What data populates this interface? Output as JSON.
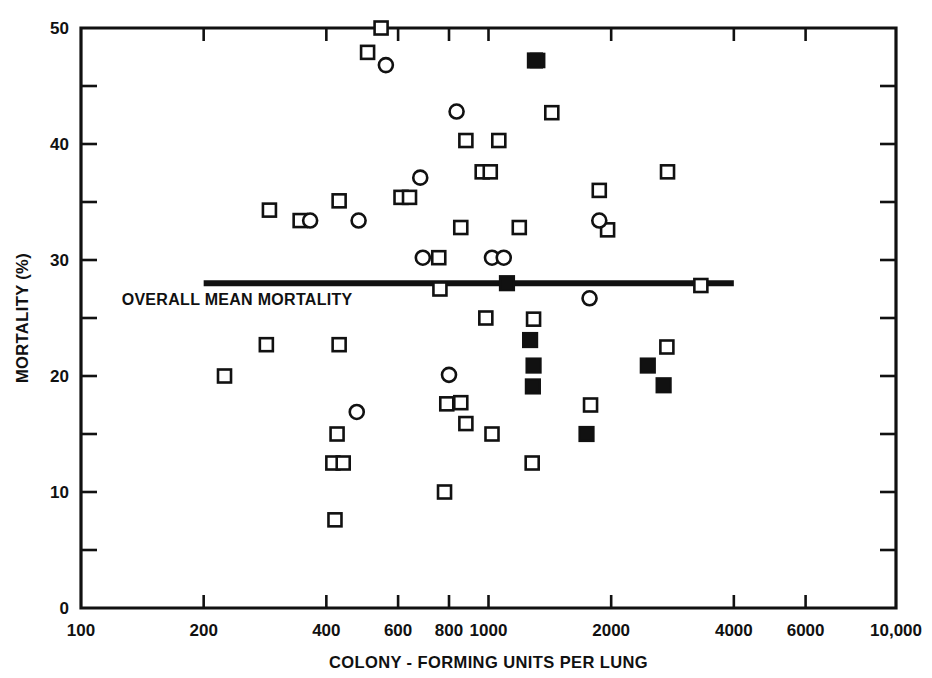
{
  "chart_data": {
    "type": "scatter",
    "title": "",
    "xlabel": "COLONY - FORMING UNITS PER LUNG",
    "ylabel": "MORTALITY (%)",
    "xscale": "log",
    "yscale": "linear",
    "xlim": [
      100,
      10000
    ],
    "ylim": [
      0,
      50
    ],
    "grid": false,
    "legend": "none",
    "x_tick_labels": [
      "100",
      "200",
      "400",
      "600",
      "800",
      "1000",
      "2000",
      "4000",
      "6000",
      "10,000"
    ],
    "x_tick_values": [
      100,
      200,
      400,
      600,
      800,
      1000,
      2000,
      4000,
      6000,
      10000
    ],
    "y_tick_labels": [
      "0",
      "10",
      "20",
      "30",
      "40",
      "50"
    ],
    "y_tick_values": [
      0,
      10,
      20,
      30,
      40,
      50
    ],
    "y_minor_ticks": [
      5,
      15,
      25,
      35,
      45
    ],
    "annotations": [
      {
        "text": "OVERALL MEAN MORTALITY",
        "type": "reference-line-label",
        "y_value": 28,
        "x_start": 200,
        "x_end": 4000
      }
    ],
    "reference_line": {
      "label": "OVERALL MEAN MORTALITY",
      "y": 28,
      "x_start": 200,
      "x_end": 4000,
      "color": "#111111"
    },
    "series": [
      {
        "name": "open-square",
        "marker": "open-square",
        "color": "#111111",
        "points": [
          {
            "x": 545,
            "y": 50.0
          },
          {
            "x": 505,
            "y": 47.9
          },
          {
            "x": 1320,
            "y": 47.2
          },
          {
            "x": 1430,
            "y": 42.7
          },
          {
            "x": 880,
            "y": 40.3
          },
          {
            "x": 1060,
            "y": 40.3
          },
          {
            "x": 2750,
            "y": 37.6
          },
          {
            "x": 965,
            "y": 37.6
          },
          {
            "x": 1010,
            "y": 37.6
          },
          {
            "x": 1870,
            "y": 36.0
          },
          {
            "x": 610,
            "y": 35.4
          },
          {
            "x": 640,
            "y": 35.4
          },
          {
            "x": 290,
            "y": 34.3
          },
          {
            "x": 430,
            "y": 35.1
          },
          {
            "x": 345,
            "y": 33.4
          },
          {
            "x": 1960,
            "y": 32.6
          },
          {
            "x": 855,
            "y": 32.8
          },
          {
            "x": 1190,
            "y": 32.8
          },
          {
            "x": 755,
            "y": 30.2
          },
          {
            "x": 3320,
            "y": 27.8
          },
          {
            "x": 760,
            "y": 27.5
          },
          {
            "x": 985,
            "y": 25.0
          },
          {
            "x": 1290,
            "y": 24.9
          },
          {
            "x": 285,
            "y": 22.7
          },
          {
            "x": 430,
            "y": 22.7
          },
          {
            "x": 2740,
            "y": 22.5
          },
          {
            "x": 225,
            "y": 20.0
          },
          {
            "x": 790,
            "y": 17.6
          },
          {
            "x": 855,
            "y": 17.7
          },
          {
            "x": 1780,
            "y": 17.5
          },
          {
            "x": 880,
            "y": 15.9
          },
          {
            "x": 1020,
            "y": 15.0
          },
          {
            "x": 425,
            "y": 15.0
          },
          {
            "x": 415,
            "y": 12.5
          },
          {
            "x": 440,
            "y": 12.5
          },
          {
            "x": 1280,
            "y": 12.5
          },
          {
            "x": 780,
            "y": 10.0
          },
          {
            "x": 420,
            "y": 7.6
          }
        ]
      },
      {
        "name": "open-circle",
        "marker": "open-circle",
        "color": "#111111",
        "points": [
          {
            "x": 560,
            "y": 46.8
          },
          {
            "x": 835,
            "y": 42.8
          },
          {
            "x": 680,
            "y": 37.1
          },
          {
            "x": 1870,
            "y": 33.4
          },
          {
            "x": 365,
            "y": 33.4
          },
          {
            "x": 480,
            "y": 33.4
          },
          {
            "x": 690,
            "y": 30.2
          },
          {
            "x": 1020,
            "y": 30.2
          },
          {
            "x": 1090,
            "y": 30.2
          },
          {
            "x": 1770,
            "y": 26.7
          },
          {
            "x": 800,
            "y": 20.1
          },
          {
            "x": 475,
            "y": 16.9
          }
        ]
      },
      {
        "name": "filled-square",
        "marker": "filled-square",
        "color": "#111111",
        "points": [
          {
            "x": 1300,
            "y": 47.2
          },
          {
            "x": 1110,
            "y": 28.0
          },
          {
            "x": 1265,
            "y": 23.1
          },
          {
            "x": 1290,
            "y": 20.9
          },
          {
            "x": 2460,
            "y": 20.9
          },
          {
            "x": 1285,
            "y": 19.1
          },
          {
            "x": 2690,
            "y": 19.2
          },
          {
            "x": 1740,
            "y": 15.0
          }
        ]
      }
    ]
  }
}
